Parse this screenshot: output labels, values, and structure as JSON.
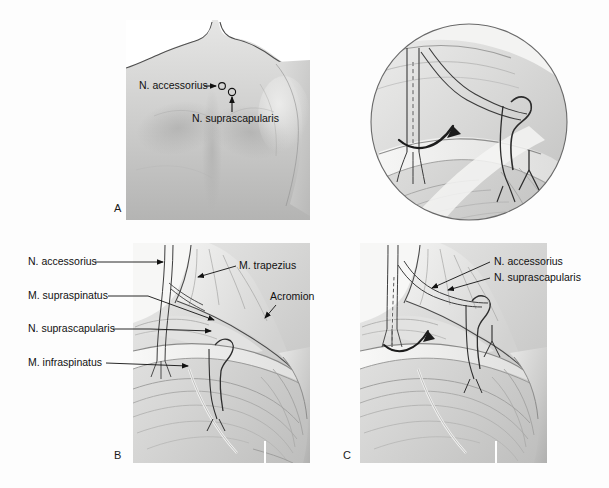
{
  "figure": {
    "background_color": "#fdfdfd",
    "ink_color": "#111111",
    "panel_count": 4
  },
  "panels": {
    "a": {
      "letter": "A",
      "view": "posterior shoulder surface anatomy photograph",
      "labels": [
        {
          "text": "N. accessorius",
          "marker": "arrow-to-circle"
        },
        {
          "text": "N. suprascapularis",
          "marker": "arrow-up-to-circle"
        }
      ]
    },
    "inset": {
      "letter": "",
      "view": "circular magnified surgical detail",
      "features": [
        "dashed-cut-line",
        "curved-transfer-arrow",
        "nerve-stump-loop",
        "forceps-marker"
      ]
    },
    "b": {
      "letter": "B",
      "view": "dissected posterior shoulder, nerves in situ",
      "labels_left": [
        {
          "text": "N. accessorius"
        },
        {
          "text": "M. supraspinatus"
        },
        {
          "text": "N. suprascapularis"
        },
        {
          "text": "M. infraspinatus"
        }
      ],
      "labels_right": [
        {
          "text": "M. trapezius"
        },
        {
          "text": "Acromion"
        }
      ]
    },
    "c": {
      "letter": "C",
      "view": "dissected posterior shoulder after nerve transfer",
      "labels_right": [
        {
          "text": "N. accessorius"
        },
        {
          "text": "N. suprascapularis"
        }
      ]
    }
  }
}
